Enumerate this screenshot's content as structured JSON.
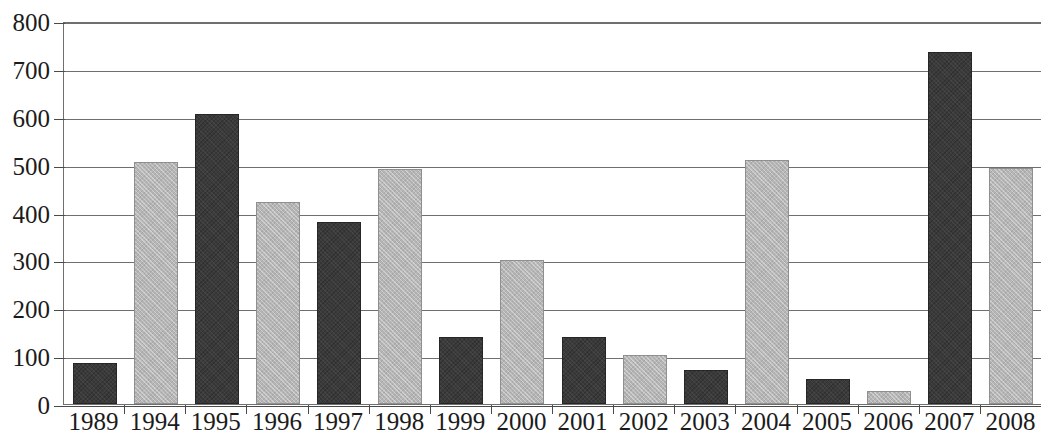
{
  "chart_data": {
    "type": "bar",
    "title": "",
    "xlabel": "",
    "ylabel": "",
    "categories": [
      "1989",
      "1994",
      "1995",
      "1996",
      "1997",
      "1998",
      "1999",
      "2000",
      "2001",
      "2002",
      "2003",
      "2004",
      "2005",
      "2006",
      "2007",
      "2008"
    ],
    "values": [
      85,
      505,
      605,
      423,
      380,
      490,
      140,
      300,
      140,
      102,
      72,
      510,
      52,
      27,
      735,
      492
    ],
    "bar_styles": [
      "dark",
      "light",
      "dark",
      "light",
      "dark",
      "light",
      "dark",
      "light",
      "dark",
      "light",
      "dark",
      "light",
      "dark",
      "light",
      "dark",
      "light"
    ],
    "ylim": [
      0,
      800
    ],
    "y_ticks": [
      "0",
      "100",
      "200",
      "300",
      "400",
      "500",
      "600",
      "700",
      "800"
    ],
    "grid": true,
    "legend": "none",
    "colors": {
      "dark_bar": "#3a3a3a",
      "light_bar": "#b5b5b5",
      "gridline": "#6f6f6f",
      "axis": "#4a4a4a",
      "background": "#ffffff",
      "text": "#1b1b1b"
    }
  }
}
